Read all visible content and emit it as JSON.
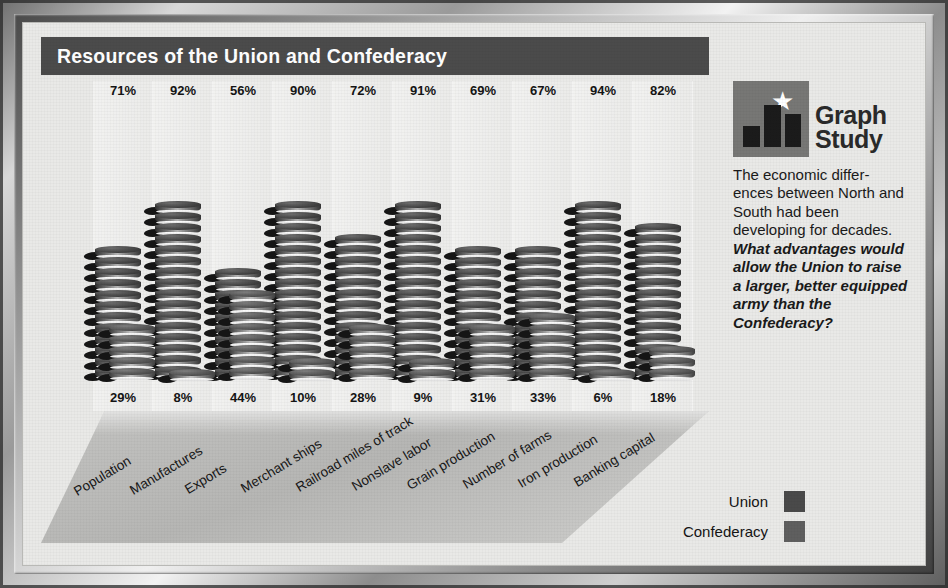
{
  "title": "Resources of the Union and Confederacy",
  "logo": {
    "line1": "Graph",
    "line2": "Study",
    "star_icon": "star-icon"
  },
  "sidebar": {
    "intro": "The economic differ-ences between North and South had been developing for decades. ",
    "question": "What advantages would allow the Union to raise a larger, better equipped army than the Confederacy?"
  },
  "legend": {
    "union_label": "Union",
    "confederacy_label": "Confederacy",
    "union_color": "#4a4a4a",
    "confederacy_color": "#5f5f5f"
  },
  "chart_data": {
    "type": "bar",
    "title": "Resources of the Union and Confederacy",
    "xlabel": "",
    "ylabel": "Percent of national total",
    "ylim": [
      0,
      100
    ],
    "grid": false,
    "legend_position": "bottom-right",
    "unit": "%",
    "categories": [
      "Population",
      "Manufactures",
      "Exports",
      "Merchant ships",
      "Railroad miles of track",
      "Nonslave labor",
      "Grain production",
      "Number of farms",
      "Iron production",
      "Banking capital"
    ],
    "series": [
      {
        "name": "Union",
        "color": "#4a4a4a",
        "values": [
          71,
          92,
          56,
          90,
          72,
          91,
          69,
          67,
          94,
          82
        ],
        "labels": [
          "71%",
          "92%",
          "56%",
          "90%",
          "72%",
          "91%",
          "69%",
          "67%",
          "94%",
          "82%"
        ]
      },
      {
        "name": "Confederacy",
        "color": "#5f5f5f",
        "values": [
          29,
          8,
          44,
          10,
          28,
          9,
          31,
          33,
          6,
          18
        ],
        "labels": [
          "29%",
          "8%",
          "44%",
          "10%",
          "28%",
          "9%",
          "31%",
          "33%",
          "6%",
          "18%"
        ]
      }
    ]
  }
}
